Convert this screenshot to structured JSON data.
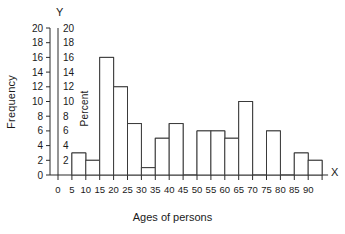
{
  "chart_data": {
    "type": "bar",
    "title": "",
    "subtitle": "",
    "xlabel": "Ages of persons",
    "ylabel": "Frequency",
    "y2label": "Percent",
    "x_axis_letter": "X",
    "y_axis_letter": "Y",
    "grid": false,
    "legend": "none",
    "bin_width": 5,
    "xlim": [
      0,
      95
    ],
    "ylim": [
      0,
      20
    ],
    "y2lim": [
      0,
      20
    ],
    "x_tick_labels": [
      "0",
      "5",
      "10",
      "15",
      "20",
      "25",
      "30",
      "35",
      "40",
      "45",
      "50",
      "55",
      "60",
      "65",
      "70",
      "75",
      "80",
      "85",
      "90"
    ],
    "x_tick_values": [
      0,
      5,
      10,
      15,
      20,
      25,
      30,
      35,
      40,
      45,
      50,
      55,
      60,
      65,
      70,
      75,
      80,
      85,
      90
    ],
    "y_tick_labels": [
      "0",
      "2",
      "4",
      "6",
      "8",
      "10",
      "12",
      "14",
      "16",
      "18",
      "20"
    ],
    "y_tick_values": [
      0,
      2,
      4,
      6,
      8,
      10,
      12,
      14,
      16,
      18,
      20
    ],
    "y2_tick_labels": [
      "2",
      "4",
      "6",
      "8",
      "10",
      "12",
      "14",
      "16",
      "18",
      "20"
    ],
    "y2_tick_values": [
      2,
      4,
      6,
      8,
      10,
      12,
      14,
      16,
      18,
      20
    ],
    "bin_starts": [
      5,
      10,
      15,
      20,
      25,
      30,
      35,
      40,
      45,
      50,
      55,
      60,
      65,
      70,
      75,
      80,
      85
    ],
    "bin_labels": [
      "5-10",
      "10-15",
      "15-20",
      "20-25",
      "25-30",
      "30-35",
      "35-40",
      "40-45",
      "45-50",
      "50-55",
      "55-60",
      "60-65",
      "65-70",
      "70-75",
      "75-80",
      "80-85",
      "85-90"
    ],
    "values": [
      3,
      2,
      16,
      12,
      7,
      1,
      5,
      7,
      0,
      6,
      6,
      5,
      10,
      0,
      6,
      0,
      3,
      2
    ],
    "categories": [
      "5-10",
      "10-15",
      "15-20",
      "20-25",
      "25-30",
      "30-35",
      "35-40",
      "40-45",
      "45-50",
      "50-55",
      "55-60",
      "60-65",
      "65-70",
      "70-75",
      "75-80",
      "80-85",
      "85-90",
      "90-95"
    ],
    "bar_color": "#ffffff",
    "bar_edge_color": "#3a3a3a",
    "axis_color": "#2b2b2b",
    "text_color": "#1a1a1a"
  }
}
